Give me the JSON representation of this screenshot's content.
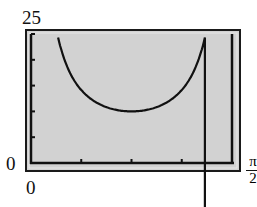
{
  "chart_data": {
    "type": "line",
    "title": "",
    "xlabel": "",
    "ylabel": "",
    "xlim": [
      0,
      1.5708
    ],
    "ylim": [
      0,
      25
    ],
    "x_tick_labels": [
      "0",
      "π/2"
    ],
    "y_tick_labels": [
      "0",
      "25"
    ],
    "x_scale_ticks": [
      "π/8",
      "π/4",
      "3π/8",
      "π/2"
    ],
    "y_scale_ticks": [
      5,
      10,
      15,
      20,
      25
    ],
    "grid": false,
    "series": [
      {
        "name": "curve",
        "x": [
          0.21,
          0.3,
          0.4,
          0.5,
          0.6,
          0.7,
          0.785,
          0.87,
          0.97,
          1.07,
          1.17,
          1.27,
          1.36
        ],
        "y": [
          24.6,
          17.8,
          13.9,
          11.9,
          10.7,
          10.2,
          10.0,
          10.2,
          10.7,
          11.9,
          13.9,
          17.8,
          24.6
        ]
      }
    ]
  },
  "labels": {
    "y_max": "25",
    "y_min": "0",
    "x_min": "0",
    "x_max_num": "π",
    "x_max_den": "2"
  },
  "colors": {
    "screen_bg": "#d2d2d2",
    "frame": "#1a1a1a",
    "curve": "#111111"
  }
}
